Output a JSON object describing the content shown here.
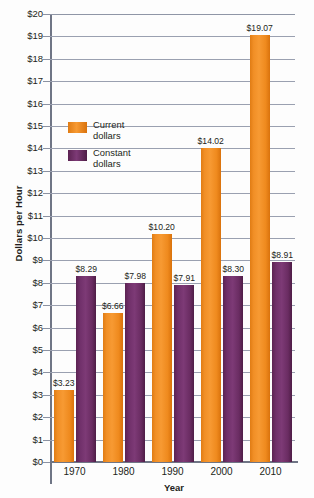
{
  "chart_data": {
    "type": "bar",
    "title": "",
    "xlabel": "Year",
    "ylabel": "Dollars per Hour",
    "categories": [
      "1970",
      "1980",
      "1990",
      "2000",
      "2010"
    ],
    "ylim": [
      0,
      20
    ],
    "ytick_step": 1,
    "grid": true,
    "legend_position": "upper-left-inside",
    "ytick_labels": [
      "$0",
      "$1",
      "$2",
      "$3",
      "$4",
      "$5",
      "$6",
      "$7",
      "$8",
      "$9",
      "$10",
      "$11",
      "$12",
      "$13",
      "$14",
      "$15",
      "$16",
      "$17",
      "$18",
      "$19",
      "$20"
    ],
    "series": [
      {
        "name": "Current dollars",
        "color": "#F18F26",
        "values": [
          3.23,
          6.66,
          10.2,
          14.02,
          19.07
        ],
        "labels": [
          "$3.23",
          "$6.66",
          "$10.20",
          "$14.02",
          "$19.07"
        ]
      },
      {
        "name": "Constant dollars",
        "color": "#70306A",
        "values": [
          8.29,
          7.98,
          7.91,
          8.3,
          8.91
        ],
        "labels": [
          "$8.29",
          "$7.98",
          "$7.91",
          "$8.30",
          "$8.91"
        ]
      }
    ]
  },
  "legend": {
    "items": [
      {
        "label_line1": "Current",
        "label_line2": "dollars",
        "color": "#F18F26"
      },
      {
        "label_line1": "Constant",
        "label_line2": "dollars",
        "color": "#70306A"
      }
    ]
  }
}
